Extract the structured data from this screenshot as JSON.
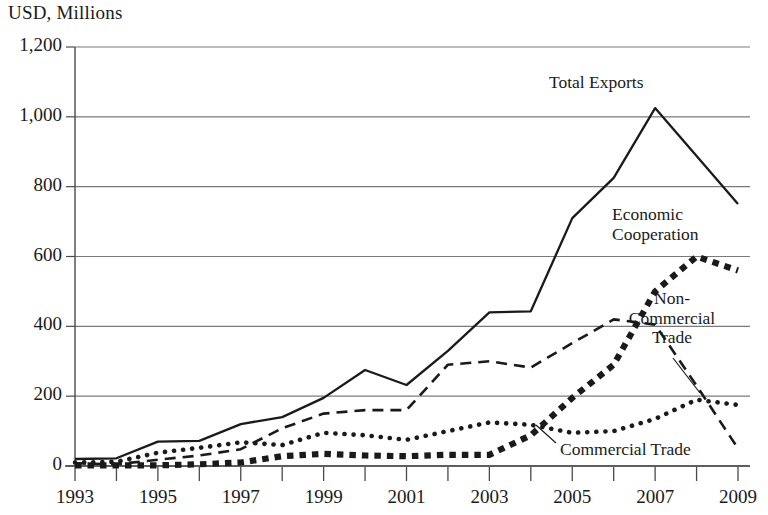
{
  "chart_data": {
    "type": "line",
    "title": "",
    "ylabel": "USD, Millions",
    "xlabel": "",
    "ylim": [
      0,
      1200
    ],
    "ytick_values": [
      0,
      200,
      400,
      600,
      800,
      1000,
      1200
    ],
    "ytick_labels": [
      "0",
      "200",
      "400",
      "600",
      "800",
      "1,000",
      "1,200"
    ],
    "xlim": [
      1993,
      2009
    ],
    "x": [
      1993,
      1994,
      1995,
      1996,
      1997,
      1998,
      1999,
      2000,
      2001,
      2002,
      2003,
      2004,
      2005,
      2006,
      2007,
      2008,
      2009
    ],
    "xtick_values": [
      1993,
      1994,
      1995,
      1996,
      1997,
      1998,
      1999,
      2000,
      2001,
      2002,
      2003,
      2004,
      2005,
      2006,
      2007,
      2008,
      2009
    ],
    "xtick_labels": [
      "1993",
      "",
      "1995",
      "",
      "1997",
      "",
      "1999",
      "",
      "2001",
      "",
      "2003",
      "",
      "2005",
      "",
      "2007",
      "",
      "2009"
    ],
    "grid": "horizontal",
    "legend": "inline-annotations",
    "series": [
      {
        "name": "Total Exports",
        "style": "solid",
        "values": [
          20,
          22,
          70,
          72,
          120,
          140,
          195,
          275,
          232,
          330,
          440,
          443,
          710,
          825,
          1025,
          888,
          750
        ]
      },
      {
        "name": "Non-Commercial Trade",
        "style": "dashed",
        "values": [
          8,
          5,
          18,
          30,
          48,
          108,
          150,
          160,
          160,
          290,
          300,
          282,
          352,
          420,
          405,
          230,
          50
        ]
      },
      {
        "name": "Commercial Trade",
        "style": "dotted-round",
        "values": [
          10,
          12,
          38,
          52,
          68,
          60,
          95,
          88,
          75,
          100,
          125,
          118,
          95,
          100,
          135,
          190,
          175
        ]
      },
      {
        "name": "Economic Cooperation",
        "style": "dotted-square",
        "values": [
          2,
          2,
          2,
          5,
          10,
          28,
          35,
          30,
          28,
          32,
          32,
          88,
          195,
          290,
          500,
          600,
          560
        ]
      }
    ],
    "annotations": [
      {
        "text": "Total Exports",
        "lines": [
          "Total Exports"
        ],
        "series": "Total Exports"
      },
      {
        "text": "Economic Cooperation",
        "lines": [
          "Economic",
          "Cooperation"
        ],
        "series": "Economic Cooperation"
      },
      {
        "text": "Non-Commercial Trade",
        "lines": [
          "Non-",
          "Commercial",
          "Trade"
        ],
        "series": "Non-Commercial Trade"
      },
      {
        "text": "Commercial Trade",
        "lines": [
          "Commercial Trade"
        ],
        "series": "Commercial Trade"
      }
    ],
    "colors": {
      "ink": "#1a1a1a",
      "gridline": "#7a7a7a",
      "axis": "#4a4a4a",
      "background": "#ffffff"
    }
  }
}
